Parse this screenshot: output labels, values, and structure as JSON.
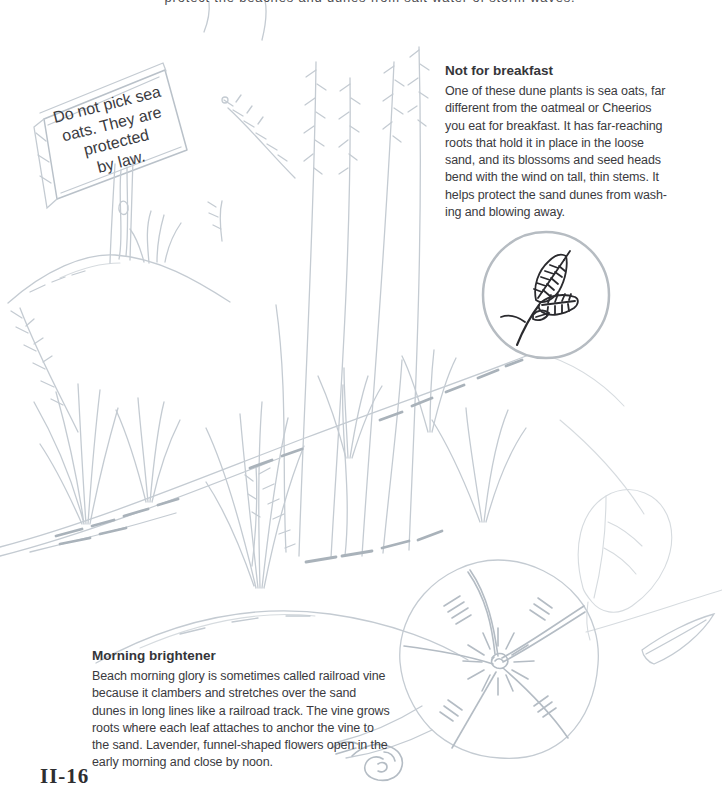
{
  "page": {
    "background_color": "#ffffff",
    "clipped_top_line": "protect the beaches and dunes from salt water of storm waves.",
    "page_number": "II-16"
  },
  "sign": {
    "lines": [
      "Do not pick sea",
      "oats. They are",
      "protected",
      "by law."
    ]
  },
  "sections": {
    "not_for_breakfast": {
      "title": "Not for breakfast",
      "body": "One of these dune plants is sea oats, far\ndifferent from the oatmeal or Cheerios\nyou eat for breakfast. It has far-reaching\nroots that hold it in place in the loose\nsand, and its blossoms and seed heads\nbend with the wind on tall, thin stems. It\nhelps protect the sand dunes from wash-\ning and blowing away."
    },
    "morning_brightener": {
      "title": "Morning brightener",
      "body": "Beach morning glory is sometimes called railroad vine\nbecause it clambers and stretches over the sand\ndunes in long lines like a railroad track. The vine grows\nroots where each leaf attaches to anchor the vine to\nthe sand. Lavender, funnel-shaped flowers open in the\nearly morning and close by noon."
    }
  },
  "illustrations": {
    "dune_scene_alt": "Pencil sketch of a sand dune with sea oats grasses and a wooden warning sign",
    "sea_oats_inset_alt": "Ink drawing of a sea oats seed head inside a circle",
    "morning_glory_alt": "Pencil sketch of a beach morning glory flower with leaf, vine and bud"
  },
  "colors": {
    "body_text": "#3a3a3e",
    "pencil_light": "#c4cbd2",
    "pencil_dark": "#a9b2ba",
    "ink": "#2a2a2e",
    "inset_circle_rim": "#b6bcc2"
  }
}
